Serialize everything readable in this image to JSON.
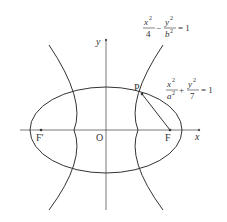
{
  "diagram": {
    "type": "conic-sections",
    "axes": {
      "x_label": "x",
      "y_label": "y",
      "origin_label": "O"
    },
    "points": {
      "P": "P",
      "F": "F",
      "F_prime": "F′"
    },
    "hyperbola": {
      "label": "hyperbola",
      "equation": "x²/4 − y²/b² = 1",
      "num1": "x",
      "den1": "4",
      "num2": "y",
      "den2": "b",
      "rhs": "= 1",
      "sup": "2",
      "op": "−"
    },
    "ellipse": {
      "label": "ellipse",
      "equation": "x²/a² + y²/7 = 1",
      "num1": "x",
      "den1": "a",
      "num2": "y",
      "den2": "7",
      "rhs": "= 1",
      "sup": "2",
      "op": "+"
    },
    "segment": "PF",
    "colors": {
      "stroke": "#333333",
      "axis": "#555555",
      "background": "#ffffff"
    }
  }
}
